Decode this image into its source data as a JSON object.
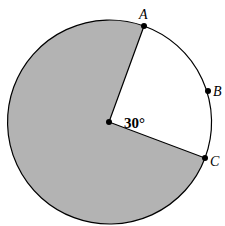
{
  "diagram": {
    "type": "circle-sector",
    "angle_label": "30°",
    "points": [
      {
        "label": "A"
      },
      {
        "label": "B"
      },
      {
        "label": "C"
      }
    ],
    "colors": {
      "shaded": "#b3b3b3",
      "stroke": "#000000",
      "background": "#ffffff"
    }
  }
}
